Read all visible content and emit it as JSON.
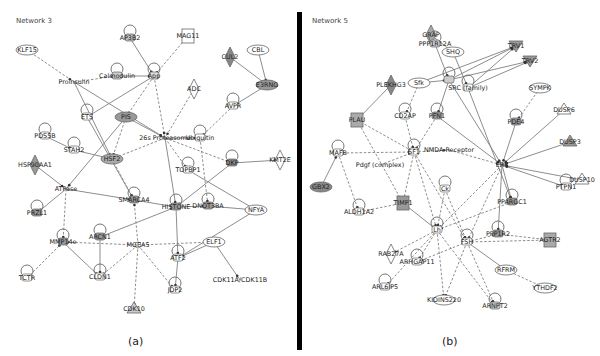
{
  "figure": {
    "panel_a": {
      "title": "Network 3",
      "caption": "(a)",
      "nodes": [
        {
          "id": "KLF15",
          "label": "KLF15",
          "x": 27,
          "y": 50,
          "shape": "oval",
          "fill": "#ffffff"
        },
        {
          "id": "AP3B2",
          "label": "AP3B2",
          "x": 130,
          "y": 38,
          "shape": "loop",
          "fill": "#bbbbbb"
        },
        {
          "id": "MAG11",
          "label": "MAG11",
          "x": 188,
          "y": 36,
          "shape": "square",
          "fill": "#ffffff"
        },
        {
          "id": "CUL2",
          "label": "CUL2",
          "x": 230,
          "y": 57,
          "shape": "diamond",
          "fill": "#888888"
        },
        {
          "id": "CBL",
          "label": "CBL",
          "x": 258,
          "y": 50,
          "shape": "oval",
          "fill": "#ffffff"
        },
        {
          "id": "Proinsulin",
          "label": "Proinsulin",
          "x": 74,
          "y": 82,
          "shape": "text",
          "fill": "#ffffff"
        },
        {
          "id": "Calmodulin",
          "label": "Calmodulin",
          "x": 117,
          "y": 76,
          "shape": "loop",
          "fill": "#cccccc"
        },
        {
          "id": "App",
          "label": "App",
          "x": 154,
          "y": 76,
          "shape": "loop",
          "fill": "#dddddd"
        },
        {
          "id": "E3RNG",
          "label": "E3RNG",
          "x": 267,
          "y": 85,
          "shape": "oval",
          "fill": "#999999"
        },
        {
          "id": "ADC",
          "label": "ADC",
          "x": 194,
          "y": 89,
          "shape": "diamond",
          "fill": "#ffffff"
        },
        {
          "id": "AVPR",
          "label": "AVPR",
          "x": 233,
          "y": 106,
          "shape": "loop",
          "fill": "#ffffff"
        },
        {
          "id": "ETS",
          "label": "ETS",
          "x": 87,
          "y": 117,
          "shape": "loop",
          "fill": "#ffffff"
        },
        {
          "id": "PIS",
          "label": "PIS",
          "x": 126,
          "y": 117,
          "shape": "oval-dark",
          "fill": "#999999"
        },
        {
          "id": "26S_Proteasome",
          "label": "26s Proteasome",
          "x": 165,
          "y": 138,
          "shape": "text",
          "fill": "#ffffff"
        },
        {
          "id": "Ubiquitin",
          "label": "Ubiquitin",
          "x": 200,
          "y": 138,
          "shape": "loop",
          "fill": "#ffffff"
        },
        {
          "id": "PDS5B",
          "label": "PDS5B",
          "x": 45,
          "y": 136,
          "shape": "loop",
          "fill": "#ffffff"
        },
        {
          "id": "STAH2",
          "label": "STAH2",
          "x": 74,
          "y": 150,
          "shape": "loop",
          "fill": "#ffffff"
        },
        {
          "id": "HSF2",
          "label": "HSF2",
          "x": 112,
          "y": 159,
          "shape": "oval",
          "fill": "#aaaaaa"
        },
        {
          "id": "TOPBP1",
          "label": "TOPBP1",
          "x": 188,
          "y": 170,
          "shape": "loop",
          "fill": "#ffffff"
        },
        {
          "id": "DKP",
          "label": "DKP",
          "x": 232,
          "y": 163,
          "shape": "loop",
          "fill": "#888888"
        },
        {
          "id": "KMT2E",
          "label": "KMT2E",
          "x": 280,
          "y": 160,
          "shape": "diamond",
          "fill": "#ffffff"
        },
        {
          "id": "HSP90AA1",
          "label": "HSP90AA1",
          "x": 35,
          "y": 165,
          "shape": "diamond",
          "fill": "#999999"
        },
        {
          "id": "ATPase",
          "label": "ATPase",
          "x": 66,
          "y": 189,
          "shape": "text",
          "fill": "#ffffff"
        },
        {
          "id": "SMARCA4",
          "label": "SMARCA4",
          "x": 134,
          "y": 200,
          "shape": "loop",
          "fill": "#999999"
        },
        {
          "id": "HISTONE",
          "label": "HISTONE",
          "x": 176,
          "y": 207,
          "shape": "loop",
          "fill": "#999999"
        },
        {
          "id": "DNOTSBA",
          "label": "DNOT3BA",
          "x": 208,
          "y": 206,
          "shape": "loop",
          "fill": "#999999"
        },
        {
          "id": "NFYA",
          "label": "NFYA",
          "x": 256,
          "y": 210,
          "shape": "oval",
          "fill": "#ffffff"
        },
        {
          "id": "PRZL1",
          "label": "PRZL1",
          "x": 37,
          "y": 213,
          "shape": "loop",
          "fill": "#999999"
        },
        {
          "id": "ARCN1",
          "label": "ARCN1",
          "x": 100,
          "y": 237,
          "shape": "loop",
          "fill": "#999999"
        },
        {
          "id": "MMP14e",
          "label": "MMP14e",
          "x": 63,
          "y": 242,
          "shape": "loop",
          "fill": "#999999"
        },
        {
          "id": "MGEA5",
          "label": "MGEA5",
          "x": 138,
          "y": 245,
          "shape": "star",
          "fill": "#ffffff"
        },
        {
          "id": "ELF1",
          "label": "ELF1",
          "x": 214,
          "y": 242,
          "shape": "oval",
          "fill": "#ffffff"
        },
        {
          "id": "ATF2",
          "label": "ATF2",
          "x": 178,
          "y": 258,
          "shape": "loop",
          "fill": "#ffffff"
        },
        {
          "id": "CLDN1",
          "label": "CLDN1",
          "x": 100,
          "y": 277,
          "shape": "loop",
          "fill": "#ffffff"
        },
        {
          "id": "TCTR",
          "label": "TCTR",
          "x": 27,
          "y": 278,
          "shape": "loop",
          "fill": "#ffffff"
        },
        {
          "id": "CDK11A_CDK11B",
          "label": "CDK11A/CDK11B",
          "x": 240,
          "y": 280,
          "shape": "text",
          "fill": "#ffffff"
        },
        {
          "id": "JDP2",
          "label": "JDP2",
          "x": 175,
          "y": 290,
          "shape": "loop",
          "fill": "#ffffff"
        },
        {
          "id": "CDK10",
          "label": "CDK10",
          "x": 134,
          "y": 309,
          "shape": "triangle",
          "fill": "#cccccc"
        }
      ]
    },
    "panel_b": {
      "title": "Network 5",
      "caption": "(b)",
      "nodes": [
        {
          "id": "GRAP",
          "label": "GRAP",
          "x": 129,
          "y": 35,
          "shape": "diamond",
          "fill": "#aaaaaa"
        },
        {
          "id": "PPP1R12A",
          "label": "PPP1R12A",
          "x": 133,
          "y": 44,
          "shape": "loop",
          "fill": "#cccccc"
        },
        {
          "id": "SHQ",
          "label": "SHQ",
          "x": 151,
          "y": 52,
          "shape": "oval",
          "fill": "#ffffff"
        },
        {
          "id": "TRV1",
          "label": "TRV1",
          "x": 214,
          "y": 46,
          "shape": "triangle-down",
          "fill": "#999999"
        },
        {
          "id": "TRV2",
          "label": "TRV2",
          "x": 228,
          "y": 61,
          "shape": "triangle-down",
          "fill": "#999999"
        },
        {
          "id": "PLEKHG3",
          "label": "PLEKHG3",
          "x": 89,
          "y": 85,
          "shape": "diamond",
          "fill": "#888888"
        },
        {
          "id": "Sfk",
          "label": "Sfk",
          "x": 117,
          "y": 83,
          "shape": "oval",
          "fill": "#ffffff"
        },
        {
          "id": "Integrin",
          "label": "",
          "x": 147,
          "y": 80,
          "shape": "loop",
          "fill": "#cccccc"
        },
        {
          "id": "SRC_family",
          "label": "SRC (family)",
          "x": 166,
          "y": 88,
          "shape": "loop",
          "fill": "#ffffff"
        },
        {
          "id": "SYMPK",
          "label": "SYMPK",
          "x": 238,
          "y": 88,
          "shape": "oval",
          "fill": "#ffffff"
        },
        {
          "id": "DUSP6",
          "label": "DUSP6",
          "x": 262,
          "y": 110,
          "shape": "triangle",
          "fill": "#ffffff"
        },
        {
          "id": "PLAU",
          "label": "PLAU",
          "x": 55,
          "y": 120,
          "shape": "square",
          "fill": "#aaaaaa"
        },
        {
          "id": "CD2AP",
          "label": "CD2AP",
          "x": 103,
          "y": 116,
          "shape": "loop",
          "fill": "#ffffff"
        },
        {
          "id": "PFN1",
          "label": "PFN1",
          "x": 135,
          "y": 116,
          "shape": "loop",
          "fill": "#999999"
        },
        {
          "id": "PDE4",
          "label": "PDE4",
          "x": 214,
          "y": 122,
          "shape": "loop",
          "fill": "#999999"
        },
        {
          "id": "MAFB",
          "label": "MAFB",
          "x": 36,
          "y": 153,
          "shape": "loop",
          "fill": "#ffffff"
        },
        {
          "id": "SF1",
          "label": "SF1",
          "x": 112,
          "y": 152,
          "shape": "loop",
          "fill": "#ffffff"
        },
        {
          "id": "NMDA_Receptor",
          "label": "NMDA Receptor",
          "x": 147,
          "y": 150,
          "shape": "text",
          "fill": "#ffffff"
        },
        {
          "id": "DUSP3",
          "label": "DUSP3",
          "x": 268,
          "y": 142,
          "shape": "triangle",
          "fill": "#999999"
        },
        {
          "id": "Pdgf_complex",
          "label": "Pdgf (complex)",
          "x": 78,
          "y": 165,
          "shape": "text",
          "fill": "#ffffff"
        },
        {
          "id": "ERK",
          "label": "ERK",
          "x": 200,
          "y": 165,
          "shape": "text",
          "fill": "#ffffff"
        },
        {
          "id": "GBX2",
          "label": "GBX2",
          "x": 19,
          "y": 187,
          "shape": "oval-dark",
          "fill": "#888888"
        },
        {
          "id": "ALDH1A2",
          "label": "ALDH1A2",
          "x": 57,
          "y": 212,
          "shape": "loop",
          "fill": "#ffffff"
        },
        {
          "id": "DUSP10",
          "label": "DUSP10",
          "x": 280,
          "y": 180,
          "shape": "triangle",
          "fill": "#ffffff"
        },
        {
          "id": "PTPN1",
          "label": "PTPN1",
          "x": 264,
          "y": 187,
          "shape": "loop",
          "fill": "#ffffff"
        },
        {
          "id": "TIMP1",
          "label": "TIMP1",
          "x": 101,
          "y": 203,
          "shape": "square",
          "fill": "#999999"
        },
        {
          "id": "Ck",
          "label": "Ck",
          "x": 143,
          "y": 189,
          "shape": "loop",
          "fill": "#ffffff"
        },
        {
          "id": "PPARGC1",
          "label": "PPARGC1",
          "x": 210,
          "y": 202,
          "shape": "loop",
          "fill": "#999999"
        },
        {
          "id": "Lh",
          "label": "Lh",
          "x": 135,
          "y": 230,
          "shape": "loop",
          "fill": "#ffffff"
        },
        {
          "id": "FSH",
          "label": "FSH",
          "x": 165,
          "y": 242,
          "shape": "loop",
          "fill": "#ffffff"
        },
        {
          "id": "PPP1R2",
          "label": "PPP1R2",
          "x": 196,
          "y": 234,
          "shape": "loop",
          "fill": "#999999"
        },
        {
          "id": "AGTR2",
          "label": "AGTR2",
          "x": 248,
          "y": 240,
          "shape": "square",
          "fill": "#aaaaaa"
        },
        {
          "id": "RAB27A",
          "label": "RAB27A",
          "x": 89,
          "y": 254,
          "shape": "diamond",
          "fill": "#ffffff"
        },
        {
          "id": "ARHGAP11",
          "label": "ARHGAP11",
          "x": 115,
          "y": 262,
          "shape": "loop",
          "fill": "#ffffff"
        },
        {
          "id": "RFRM",
          "label": "RFRM",
          "x": 204,
          "y": 270,
          "shape": "oval",
          "fill": "#ffffff"
        },
        {
          "id": "ARL6IP5",
          "label": "ARL6IP5",
          "x": 83,
          "y": 287,
          "shape": "loop",
          "fill": "#ffffff"
        },
        {
          "id": "YTHDF2",
          "label": "YTHDF2",
          "x": 243,
          "y": 288,
          "shape": "oval",
          "fill": "#ffffff"
        },
        {
          "id": "KIDINS220",
          "label": "KIDINS220",
          "x": 142,
          "y": 300,
          "shape": "oval",
          "fill": "#ffffff"
        },
        {
          "id": "ARNPT2",
          "label": "ARNPT2",
          "x": 193,
          "y": 306,
          "shape": "loop",
          "fill": "#cccccc"
        }
      ]
    }
  },
  "legend_colors": {
    "edge_color": "#777777",
    "divider_color": "#000000",
    "highlight_fill": "#999999"
  }
}
